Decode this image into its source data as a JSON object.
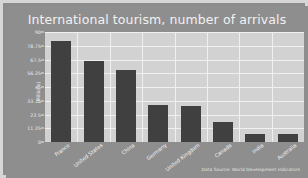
{
  "chart_data": {
    "type": "bar",
    "title": "International tourism, number of arrivals",
    "xlabel": "",
    "ylabel": "(Millions)",
    "categories": [
      "France",
      "United States",
      "China",
      "Germany",
      "United Kingdom",
      "Canada",
      "India",
      "Australia"
    ],
    "values": [
      83.0,
      66.5,
      59.0,
      30.5,
      29.5,
      16.0,
      6.5,
      6.5
    ],
    "ylim": [
      0,
      90
    ],
    "yticks": [
      0,
      11.25,
      22.5,
      33.75,
      45,
      56.25,
      67.5,
      78.75,
      90
    ],
    "ytick_labels": [
      "0",
      "11.25",
      "22.5",
      "33.75",
      "45",
      "56.25",
      "67.5",
      "78.75",
      "90"
    ],
    "grid": true,
    "legend": false,
    "annotation": "Data Source: World Development Indicators",
    "colors": {
      "bar": "#404040",
      "plot_background": "#d2d2d2",
      "figure_background": "#8e8e8e",
      "gridline": "#f0f0f0",
      "text": "#f2f2f2",
      "frame": "#d6d6d6"
    }
  }
}
